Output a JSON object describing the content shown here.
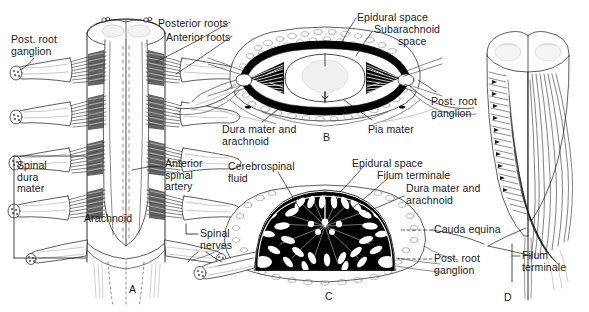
{
  "figure": {
    "type": "anatomical-illustration",
    "background_color": "#ffffff",
    "ink_color": "#1a1a1a"
  },
  "panels": [
    {
      "id": "A",
      "letter": "A",
      "letter_pos": {
        "x": 129,
        "y": 283
      },
      "caption": "Posterior view of spinal cord with dura opened"
    },
    {
      "id": "B",
      "letter": "B",
      "letter_pos": {
        "x": 323,
        "y": 131
      },
      "caption": "Transverse section of spinal cord in vertebral canal"
    },
    {
      "id": "C",
      "letter": "C",
      "letter_pos": {
        "x": 325,
        "y": 290
      },
      "caption": "Transverse section at level of cauda equina"
    },
    {
      "id": "D",
      "letter": "D",
      "letter_pos": {
        "x": 504,
        "y": 291
      },
      "caption": "Lower end of spinal cord with cauda equina and filum terminale"
    }
  ],
  "labels": [
    {
      "id": "a-post-root-ganglion",
      "lines": [
        "Post. root",
        "ganglion"
      ],
      "x": 11,
      "y": 34,
      "align": "left"
    },
    {
      "id": "a-posterior-roots",
      "lines": [
        "Posterior roots"
      ],
      "x": 158,
      "y": 18,
      "align": "left"
    },
    {
      "id": "a-anterior-roots",
      "lines": [
        "Anterior roots"
      ],
      "x": 166,
      "y": 32,
      "align": "left"
    },
    {
      "id": "a-spinal-dura-mater",
      "lines": [
        "Spinal",
        "dura",
        "mater"
      ],
      "x": 17,
      "y": 160,
      "align": "left"
    },
    {
      "id": "a-anterior-spinal-artery",
      "lines": [
        "Anterior",
        "spinal",
        "artery"
      ],
      "x": 165,
      "y": 158,
      "align": "left"
    },
    {
      "id": "a-arachnoid",
      "lines": [
        "Arachnoid"
      ],
      "x": 84,
      "y": 213,
      "align": "left"
    },
    {
      "id": "a-spinal-nerves",
      "lines": [
        "Spinal",
        "nerves"
      ],
      "x": 200,
      "y": 228,
      "align": "left"
    },
    {
      "id": "b-epidural-space",
      "lines": [
        "Epidural space"
      ],
      "x": 357,
      "y": 12,
      "align": "left"
    },
    {
      "id": "b-subarachnoid",
      "lines": [
        "Subarachnoid"
      ],
      "x": 374,
      "y": 24,
      "align": "left"
    },
    {
      "id": "b-subarachnoid-space",
      "lines": [
        "space"
      ],
      "x": 398,
      "y": 36,
      "align": "left"
    },
    {
      "id": "b-post-root-ganglion",
      "lines": [
        "Post. root",
        "ganglion"
      ],
      "x": 431,
      "y": 96,
      "align": "left"
    },
    {
      "id": "b-dura-mater-arachnoid",
      "lines": [
        "Dura mater and",
        "arachnoid"
      ],
      "x": 222,
      "y": 124,
      "align": "left"
    },
    {
      "id": "b-pia-mater",
      "lines": [
        "Pia mater"
      ],
      "x": 368,
      "y": 124,
      "align": "left"
    },
    {
      "id": "c-cerebrospinal-fluid",
      "lines": [
        "Cerebrospinal",
        "fluid"
      ],
      "x": 228,
      "y": 161,
      "align": "left"
    },
    {
      "id": "c-epidural-space",
      "lines": [
        "Epidural space"
      ],
      "x": 352,
      "y": 158,
      "align": "left"
    },
    {
      "id": "c-filum-terminale",
      "lines": [
        "Filum terminale"
      ],
      "x": 377,
      "y": 170,
      "align": "left"
    },
    {
      "id": "c-dura-mater-arachnoid",
      "lines": [
        "Dura mater and",
        "arachnoid"
      ],
      "x": 406,
      "y": 183,
      "align": "left"
    },
    {
      "id": "c-cauda-equina",
      "lines": [
        "Cauda equina"
      ],
      "x": 434,
      "y": 224,
      "align": "left"
    },
    {
      "id": "c-post-root-ganglion",
      "lines": [
        "Post. root",
        "ganglion"
      ],
      "x": 434,
      "y": 253,
      "align": "left"
    },
    {
      "id": "d-filum-terminale",
      "lines": [
        "Filum",
        "terminale"
      ],
      "x": 522,
      "y": 250,
      "align": "left"
    }
  ],
  "colors": {
    "ink": "#1a1a1a",
    "fill_white": "#ffffff",
    "fill_black": "#000000",
    "fill_gray": "#e8e8e8",
    "fill_light": "#f4f4f4"
  }
}
